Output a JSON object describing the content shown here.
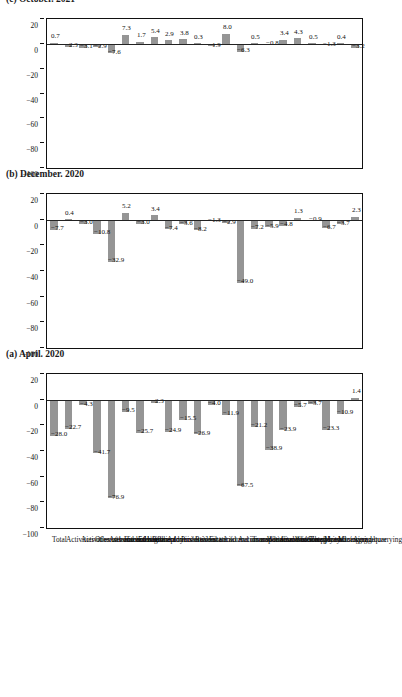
{
  "figure": {
    "orientation": "rotated-90",
    "bar_color": "#959595",
    "axis_color": "#111111",
    "grid_color": "#e2e2e2"
  },
  "categories": [
    "Agriculture",
    "Mining and quarrying",
    "Manufacturing",
    "Electricity",
    "Water supply and sewerage",
    "Construction",
    "Wholesale and retail trade",
    "Transportation and storage",
    "Accommodation and food service act.",
    "Information and communication",
    "Financial and insurance act.",
    "Real estate act.",
    "Professional act.",
    "Administrative act.",
    "Public administration",
    "Education",
    "Human health act",
    "Arts and entertainment",
    "Other service activities",
    "Activities of households as employers",
    "Activities of extraterritorial org.",
    "Total"
  ],
  "axis": {
    "ticks": [
      20,
      0,
      -20,
      -40,
      -60,
      -80,
      -100
    ],
    "tick_labels": [
      "20",
      "0",
      "-20",
      "-40",
      "-60",
      "-80",
      "-100"
    ],
    "min": -100,
    "max": 20
  },
  "panels": [
    {
      "id": "a",
      "title": "(a) April. 2020",
      "values": [
        1.4,
        -10.9,
        -23.3,
        -3.7,
        -5.7,
        -23.9,
        -38.9,
        -21.2,
        -67.5,
        -11.9,
        -4.0,
        -26.9,
        -15.5,
        -24.9,
        -2.3,
        -25.7,
        -9.5,
        -76.9,
        -41.7,
        -4.3,
        -22.7,
        -28.0
      ],
      "labels": [
        "1.4",
        "-10.9",
        "-23.3",
        "-3.7",
        "-5.7",
        "-23.9",
        "-38.9",
        "-21.2",
        "-67.5",
        "-11.9",
        "-4.0",
        "-26.9",
        "-15.5",
        "-24.9",
        "-2.3",
        "-25.7",
        "-9.5",
        "-76.9",
        "-41.7",
        "-4.3",
        "-22.7",
        "-28.0"
      ]
    },
    {
      "id": "b",
      "title": "(b) December. 2020",
      "values": [
        2.3,
        -3.7,
        -6.7,
        -0.9,
        1.3,
        -4.8,
        -5.9,
        -7.2,
        -49.0,
        -2.9,
        -1.3,
        -8.2,
        -3.6,
        -7.4,
        3.4,
        -3.0,
        5.2,
        -32.9,
        -10.8,
        -3.0,
        0.4,
        -7.7
      ],
      "labels": [
        "2.3",
        "-3.7",
        "-6.7",
        "-0.9",
        "1.3",
        "-4.8",
        "-5.9",
        "-7.2",
        "-49.0",
        "-2.9",
        "-1.3",
        "-8.2",
        "-3.6",
        "-7.4",
        "3.4",
        "-3.0",
        "5.2",
        "-32.9",
        "-10.8",
        "-3.0",
        "0.4",
        "-7.7"
      ]
    },
    {
      "id": "c",
      "title": "(c) October. 2021",
      "values": [
        -3.2,
        0.4,
        -1.3,
        0.5,
        4.3,
        3.4,
        -0.8,
        0.5,
        -6.3,
        8.0,
        -1.9,
        0.3,
        3.8,
        2.9,
        5.4,
        1.7,
        7.3,
        -7.6,
        -2.9,
        -3.1,
        -2.3,
        0.7
      ],
      "labels": [
        "-3.2",
        "0.4",
        "-1.3",
        "0.5",
        "4.3",
        "3.4",
        "-0.8",
        "0.5",
        "-6.3",
        "8.0",
        "-1.9",
        "0.3",
        "3.8",
        "2.9",
        "5.4",
        "1.7",
        "7.3",
        "-7.6",
        "-2.9",
        "-3.1",
        "-2.3",
        "0.7"
      ]
    }
  ],
  "chart_data": {
    "type": "bar",
    "title": "",
    "orientation": "vertical",
    "categories": [
      "Agriculture",
      "Mining and quarrying",
      "Manufacturing",
      "Electricity",
      "Water supply and sewerage",
      "Construction",
      "Wholesale and retail trade",
      "Transportation and storage",
      "Accommodation and food service act.",
      "Information and communication",
      "Financial and insurance act.",
      "Real estate act.",
      "Professional act.",
      "Administrative act.",
      "Public administration",
      "Education",
      "Human health act",
      "Arts and entertainment",
      "Other service activities",
      "Activities of households as employers",
      "Activities of extraterritorial org.",
      "Total"
    ],
    "series": [
      {
        "name": "(a) April. 2020",
        "values": [
          1.4,
          -10.9,
          -23.3,
          -3.7,
          -5.7,
          -23.9,
          -38.9,
          -21.2,
          -67.5,
          -11.9,
          -4.0,
          -26.9,
          -15.5,
          -24.9,
          -2.3,
          -25.7,
          -9.5,
          -76.9,
          -41.7,
          -4.3,
          -22.7,
          -28.0
        ]
      },
      {
        "name": "(b) December. 2020",
        "values": [
          2.3,
          -3.7,
          -6.7,
          -0.9,
          1.3,
          -4.8,
          -5.9,
          -7.2,
          -49.0,
          -2.9,
          -1.3,
          -8.2,
          -3.6,
          -7.4,
          3.4,
          -3.0,
          5.2,
          -32.9,
          -10.8,
          -3.0,
          0.4,
          -7.7
        ]
      },
      {
        "name": "(c) October. 2021",
        "values": [
          -3.2,
          0.4,
          -1.3,
          0.5,
          4.3,
          3.4,
          -0.8,
          0.5,
          -6.3,
          8.0,
          -1.9,
          0.3,
          3.8,
          2.9,
          5.4,
          1.7,
          7.3,
          -7.6,
          -2.9,
          -3.1,
          -2.3,
          0.7
        ]
      }
    ],
    "xlabel": "",
    "ylabel": "",
    "ylim": [
      -100,
      20
    ],
    "yticks": [
      20,
      0,
      -20,
      -40,
      -60,
      -80,
      -100
    ],
    "grid": true,
    "legend": "none",
    "panels": [
      "(a) April. 2020",
      "(b) December. 2020",
      "(c) October. 2021"
    ],
    "data_labels": true
  }
}
